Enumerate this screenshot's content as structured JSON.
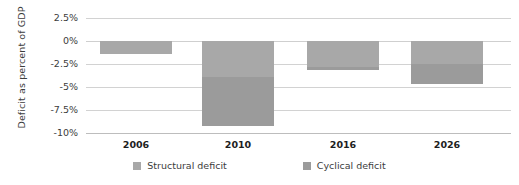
{
  "chart_data": {
    "type": "bar",
    "subtype": "stacked-bar",
    "title": "",
    "xlabel": "",
    "ylabel": "Deficit as percent of GDP",
    "categories": [
      "2006",
      "2010",
      "2016",
      "2026"
    ],
    "series": [
      {
        "name": "Structural deficit",
        "color": "#a8a8a8",
        "values": [
          -1.4,
          -3.9,
          -2.8,
          -2.5
        ]
      },
      {
        "name": "Cyclical deficit",
        "color": "#9b9b9b",
        "values": [
          0.0,
          -5.3,
          -0.3,
          -2.2
        ]
      }
    ],
    "totals": [
      -1.4,
      -9.2,
      -3.1,
      -4.7
    ],
    "ylim": [
      -10,
      2.5
    ],
    "ytick_values": [
      2.5,
      0,
      -2.5,
      -5,
      -7.5,
      -10
    ],
    "ytick_labels": [
      "2.5%",
      "0%",
      "-2.5%",
      "-5%",
      "-7.5%",
      "-10%"
    ],
    "grid": true,
    "grid_axis": "y",
    "legend_position": "bottom",
    "legend_entries": [
      "Structural deficit",
      "Cyclical deficit"
    ]
  },
  "axis": {
    "y_title": "Deficit as percent of GDP",
    "ticks": [
      {
        "label": "2.5%"
      },
      {
        "label": "0%"
      },
      {
        "label": "-2.5%"
      },
      {
        "label": "-5%"
      },
      {
        "label": "-7.5%"
      },
      {
        "label": "-10%"
      }
    ]
  },
  "categories": [
    {
      "label": "2006"
    },
    {
      "label": "2010"
    },
    {
      "label": "2016"
    },
    {
      "label": "2026"
    }
  ],
  "legend": {
    "items": [
      {
        "label": "Structural deficit",
        "color": "#a8a8a8"
      },
      {
        "label": "Cyclical deficit",
        "color": "#9b9b9b"
      }
    ]
  }
}
